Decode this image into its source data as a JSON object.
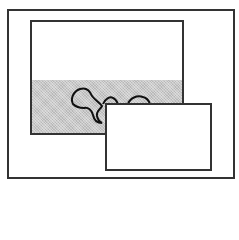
{
  "diagram": {
    "colors": {
      "stroke": "#333333",
      "background": "#ffffff",
      "shaded_band": "#c8c8c8"
    },
    "shapes": {
      "outer_frame": {
        "x": 7,
        "y": 9,
        "w": 228,
        "h": 170
      },
      "inner_window": {
        "x": 30,
        "y": 20,
        "w": 154,
        "h": 115
      },
      "shaded_band": {
        "y_start": 80,
        "y_end": 133
      },
      "overlap_rect": {
        "x": 105,
        "y": 103,
        "w": 107,
        "h": 68
      },
      "blobs": [
        "large-blob",
        "small-bump-1",
        "small-bump-2"
      ]
    }
  }
}
